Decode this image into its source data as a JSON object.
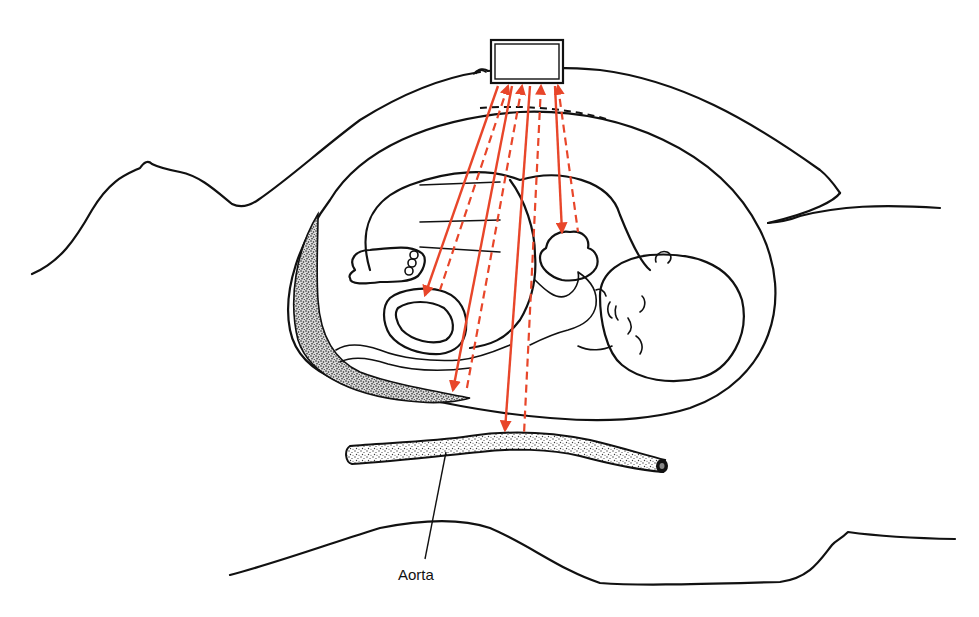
{
  "diagram": {
    "labels": {
      "aorta": "Aorta"
    },
    "components": [
      "transducer",
      "maternal-body-outline",
      "uterus",
      "placenta",
      "fetus",
      "fetal-heart",
      "umbilical-cord",
      "aorta"
    ],
    "beams": {
      "count_solid": 4,
      "count_dashed": 4,
      "targets": [
        "umbilical-cord",
        "placenta",
        "aorta",
        "fetal-heart"
      ]
    },
    "colors": {
      "beam": "#e8462a",
      "ink": "#111111",
      "background": "#ffffff",
      "stipple": "#3a3a3a"
    }
  }
}
